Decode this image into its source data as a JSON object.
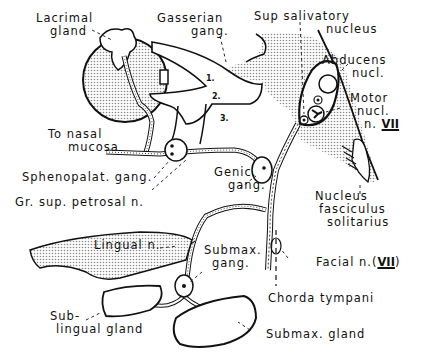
{
  "diagram": {
    "colors": {
      "ink": "#111111",
      "stipple": "#bdbdbd",
      "background": "#ffffff"
    },
    "labels": {
      "lacrimal_gland": [
        "Lacrimal",
        "gland"
      ],
      "gasserian_gang": [
        "Gasserian",
        "gang."
      ],
      "sup_salivatory_nucleus": [
        "Sup salivatory",
        "nucleus"
      ],
      "abducens_nucl": [
        "Abducens",
        "nucl."
      ],
      "motor_nucl": [
        "Motor",
        "nucl.",
        "n."
      ],
      "motor_nucl_roman": "VII",
      "to_nasal_mucosa": [
        "To nasal",
        "mucosa"
      ],
      "sphenopalat_gang": "Sphenopalat. gang.",
      "gr_sup_petrosal_n": "Gr. sup. petrosal  n.",
      "genic_gang": [
        "Genic.",
        "gang."
      ],
      "nucleus_fasciculus_solitarius": [
        "Nucleus",
        "fasciculus",
        "solitarius"
      ],
      "lingual_n": "Lingual n.",
      "submax_gang": [
        "Submax.",
        "gang."
      ],
      "facial_n": "Facial n.(",
      "facial_n_roman": "VII",
      "facial_n_close": ")",
      "chorda_tympani": "Chorda  tympani",
      "sublingual_gland": [
        "Sub-",
        "lingual  gland"
      ],
      "submax_gland": "Submax. gland"
    },
    "trigeminal_divisions": [
      "1.",
      "2.",
      "3."
    ]
  }
}
